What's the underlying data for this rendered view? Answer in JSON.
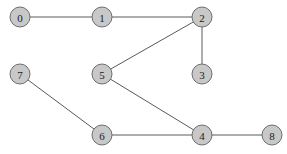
{
  "diagram": {
    "type": "undirected-graph",
    "node_radius": 10,
    "colors": {
      "node_fill": "#c8c8c8",
      "node_stroke": "#6e6e6e",
      "edge": "#5a5a5a",
      "label": "#222222",
      "background": "#ffffff"
    },
    "nodes": [
      {
        "id": "0",
        "label": "0",
        "x": 20,
        "y": 17
      },
      {
        "id": "1",
        "label": "1",
        "x": 102,
        "y": 17
      },
      {
        "id": "2",
        "label": "2",
        "x": 202,
        "y": 17
      },
      {
        "id": "3",
        "label": "3",
        "x": 202,
        "y": 74
      },
      {
        "id": "4",
        "label": "4",
        "x": 202,
        "y": 135
      },
      {
        "id": "5",
        "label": "5",
        "x": 102,
        "y": 74
      },
      {
        "id": "6",
        "label": "6",
        "x": 102,
        "y": 135
      },
      {
        "id": "7",
        "label": "7",
        "x": 20,
        "y": 74
      },
      {
        "id": "8",
        "label": "8",
        "x": 272,
        "y": 135
      }
    ],
    "edges": [
      {
        "from": "0",
        "to": "1"
      },
      {
        "from": "1",
        "to": "2"
      },
      {
        "from": "2",
        "to": "5"
      },
      {
        "from": "2",
        "to": "3"
      },
      {
        "from": "5",
        "to": "4"
      },
      {
        "from": "7",
        "to": "6"
      },
      {
        "from": "6",
        "to": "4"
      },
      {
        "from": "4",
        "to": "8"
      }
    ]
  }
}
